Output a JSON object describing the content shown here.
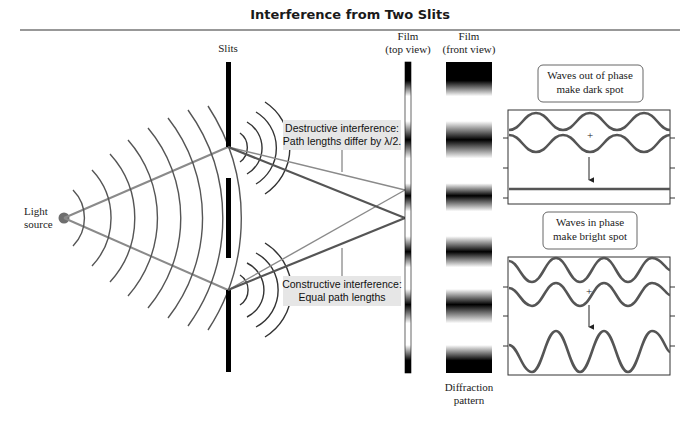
{
  "title": "Interference from Two Slits",
  "labels": {
    "light_source_1": "Light",
    "light_source_2": "source",
    "slits": "Slits",
    "film_top_1": "Film",
    "film_top_2": "(top view)",
    "film_front_1": "Film",
    "film_front_2": "(front view)",
    "diffraction_1": "Diffraction",
    "diffraction_2": "pattern"
  },
  "callouts": {
    "destructive_1": "Destructive interference:",
    "destructive_2": "Path lengths differ by λ/2.",
    "constructive_1": "Constructive interference:",
    "constructive_2": "Equal path lengths"
  },
  "panels": {
    "out_of_phase_1": "Waves out of phase",
    "out_of_phase_2": "make dark spot",
    "in_phase_1": "Waves in phase",
    "in_phase_2": "make bright spot",
    "plus": "+"
  },
  "colors": {
    "wave": "#555555",
    "ray": "#8a8a8a",
    "callout_bg": "#e6e6e6",
    "source_dot": "#6e6e6e"
  }
}
